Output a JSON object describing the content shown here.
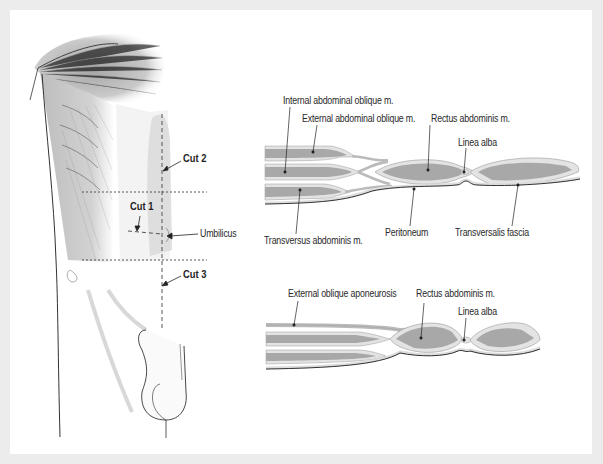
{
  "figure": {
    "panel_background": "#ffffff",
    "frame_background": "#ececec",
    "muscle_fill": "#a9a9a9",
    "sheath_fill": "#e6e6e6",
    "outline_color": "#555555"
  },
  "torso_view": {
    "cuts": [
      {
        "label": "Cut 2"
      },
      {
        "label": "Cut 1"
      },
      {
        "label": "Cut 3"
      }
    ],
    "umbilicus_label": "Umbilicus"
  },
  "section_upper": {
    "labels": {
      "internal_oblique": "Internal abdominal oblique m.",
      "external_oblique": "External abdominal oblique m.",
      "rectus": "Rectus abdominis m.",
      "linea_alba": "Linea alba",
      "transversus": "Transversus abdominis m.",
      "peritoneum": "Peritoneum",
      "transversalis": "Transversalis fascia"
    }
  },
  "section_lower": {
    "labels": {
      "ext_aponeurosis": "External oblique aponeurosis",
      "rectus": "Rectus abdominis m.",
      "linea_alba": "Linea alba"
    }
  }
}
